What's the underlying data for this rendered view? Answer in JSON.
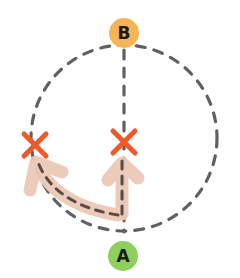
{
  "diagram": {
    "type": "path-diagram",
    "nodes": [
      {
        "id": "B",
        "label": "B",
        "color": "#f5b455",
        "position": "top"
      },
      {
        "id": "A",
        "label": "A",
        "color": "#8fcf5e",
        "position": "bottom"
      }
    ],
    "paths": [
      {
        "name": "circle-route",
        "style": "dashed",
        "color": "#5f5f60"
      },
      {
        "name": "straight-route",
        "style": "dashed",
        "color": "#5f5f60",
        "from": "A",
        "to": "B"
      }
    ],
    "blocked_points": [
      {
        "name": "left-blocked",
        "marker": "x",
        "color": "#ef5a2a"
      },
      {
        "name": "center-blocked",
        "marker": "x",
        "color": "#ef5a2a"
      }
    ],
    "arrows": [
      {
        "name": "arrow-to-left",
        "color": "#edc9b8"
      },
      {
        "name": "arrow-up-center",
        "color": "#edc9b8"
      }
    ]
  }
}
